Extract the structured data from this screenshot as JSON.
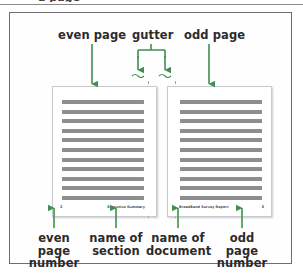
{
  "figure": {
    "top_fragment_text": "a page",
    "accent_color": "#3f8f4f",
    "frame_color": "#6e6e72",
    "text_line_color": "#8e8e90",
    "gutter_guide_color": "#9aa3ae"
  },
  "callouts": {
    "top": [
      {
        "id": "even-page",
        "label": "even page"
      },
      {
        "id": "gutter",
        "label": "gutter"
      },
      {
        "id": "odd-page",
        "label": "odd page"
      }
    ],
    "bottom": [
      {
        "id": "even-page-number",
        "line1": "even page",
        "line2": "number"
      },
      {
        "id": "name-of-section",
        "line1": "name of",
        "line2": "section"
      },
      {
        "id": "name-of-document",
        "line1": "name of",
        "line2": "document"
      },
      {
        "id": "odd-page-number",
        "line1": "odd page",
        "line2": "number"
      }
    ]
  },
  "spread": {
    "even_page": {
      "name": "even-page",
      "line_count": 11,
      "footer": {
        "page_number": "2",
        "section_name": "Executive Summary"
      }
    },
    "odd_page": {
      "name": "odd-page",
      "line_count": 11,
      "footer": {
        "document_name": "BroadBand Survey Report",
        "page_number": "3"
      }
    }
  }
}
